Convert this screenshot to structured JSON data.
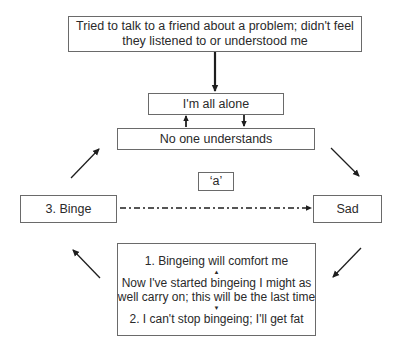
{
  "diagram": {
    "type": "cycle-flowchart",
    "nodes": {
      "trigger": {
        "line1": "Tried to talk to a friend about a problem; didn't feel",
        "line2": "they listened to or understood me"
      },
      "alone": {
        "label": "I'm all alone"
      },
      "no_one": {
        "label": "No one understands"
      },
      "label_a": {
        "label": "‘a’"
      },
      "binge": {
        "label": "3. Binge"
      },
      "sad": {
        "label": "Sad"
      },
      "thoughts": {
        "line1": "1. Bingeing will comfort me",
        "up_marker": "▲",
        "line2": "Now I've started bingeing I might as",
        "line3": "well carry on; this will be the last time",
        "down_marker": "▼",
        "line4": "2. I can't stop bingeing; I'll get fat"
      }
    },
    "edges": [
      {
        "from": "trigger",
        "to": "alone",
        "style": "solid-thick"
      },
      {
        "from": "no_one",
        "to": "alone",
        "style": "solid"
      },
      {
        "from": "alone",
        "to": "no_one",
        "style": "solid"
      },
      {
        "from": "no_one",
        "to": "sad",
        "style": "solid"
      },
      {
        "from": "sad",
        "to": "thoughts",
        "style": "solid"
      },
      {
        "from": "thoughts",
        "to": "binge",
        "style": "solid"
      },
      {
        "from": "binge",
        "to": "no_one",
        "style": "solid"
      },
      {
        "from": "binge",
        "to": "sad",
        "style": "dash-dot",
        "label": "‘a’"
      }
    ],
    "colors": {
      "line": "#1e1e1e",
      "border": "#6a6a6a",
      "text": "#2a2a2a"
    }
  }
}
